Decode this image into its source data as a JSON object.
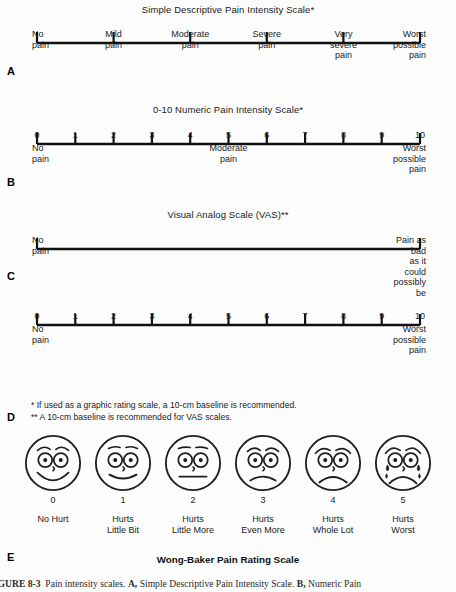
{
  "figure": {
    "caption_prefix": "FIGURE 8-3",
    "caption_text": "Pain intensity scales.",
    "caption_a_letter": "A,",
    "caption_a_text": "Simple Descriptive Pain Intensity Scale.",
    "caption_b_letter": "B,",
    "caption_b_text": "Numeric Pain",
    "colors": {
      "ink": "#1a1a1a",
      "line": "#111111",
      "background": "#fdfdfd"
    }
  },
  "panels": {
    "a": {
      "letter": "A",
      "title": "Simple Descriptive Pain Intensity Scale*",
      "tick_count": 6,
      "labels": [
        "No\npain",
        "Mild\npain",
        "Moderate\npain",
        "Severe\npain",
        "Very\nsevere\npain",
        "Worst\npossible\npain"
      ]
    },
    "b": {
      "letter": "B",
      "title": "0-10 Numeric Pain Intensity Scale*",
      "numbers": [
        "0",
        "1",
        "2",
        "3",
        "4",
        "5",
        "6",
        "7",
        "8",
        "9",
        "10"
      ],
      "anchors": [
        {
          "at": 0,
          "text": "No\npain",
          "align": "left"
        },
        {
          "at": 5,
          "text": "Moderate\npain",
          "align": "center"
        },
        {
          "at": 10,
          "text": "Worst\npossible\npain",
          "align": "right"
        }
      ]
    },
    "c": {
      "letter": "C",
      "title": "Visual Analog Scale (VAS)**",
      "anchors": [
        {
          "at": 0,
          "text": "No\npain",
          "align": "left"
        },
        {
          "at": 1,
          "text": "Pain as bad\nas it could\npossibly be",
          "align": "right"
        }
      ]
    },
    "d": {
      "letter": "D",
      "title": "",
      "numbers": [
        "0",
        "1",
        "2",
        "3",
        "4",
        "5",
        "6",
        "7",
        "8",
        "9",
        "10"
      ],
      "anchors": [
        {
          "at": 0,
          "text": "No\npain",
          "align": "left"
        },
        {
          "at": 10,
          "text": "Worst\npossible\npain",
          "align": "right"
        }
      ],
      "footnote_1": "* If used as a graphic rating scale, a 10-cm baseline is recommended.",
      "footnote_2": "** A 10-cm baseline is recommended for VAS scales."
    },
    "e": {
      "letter": "E",
      "title": "Wong-Baker Pain Rating Scale",
      "faces": [
        {
          "value": "0",
          "label": "No Hurt",
          "expression": "big-smile"
        },
        {
          "value": "1",
          "label": "Hurts\nLittle Bit",
          "expression": "slight-smile"
        },
        {
          "value": "2",
          "label": "Hurts\nLittle More",
          "expression": "neutral"
        },
        {
          "value": "3",
          "label": "Hurts\nEven More",
          "expression": "frown"
        },
        {
          "value": "4",
          "label": "Hurts\nWhole Lot",
          "expression": "deep-frown"
        },
        {
          "value": "5",
          "label": "Hurts\nWorst",
          "expression": "crying"
        }
      ]
    }
  },
  "chart_data": {
    "type": "table",
    "title": "Pain intensity scales",
    "scales": [
      {
        "name": "Simple Descriptive Pain Intensity Scale",
        "type": "categorical",
        "categories": [
          "No pain",
          "Mild pain",
          "Moderate pain",
          "Severe pain",
          "Very severe pain",
          "Worst possible pain"
        ],
        "values": [
          0,
          1,
          2,
          3,
          4,
          5
        ]
      },
      {
        "name": "0-10 Numeric Pain Intensity Scale",
        "type": "numeric",
        "ticks": [
          0,
          1,
          2,
          3,
          4,
          5,
          6,
          7,
          8,
          9,
          10
        ],
        "anchor_labels": {
          "0": "No pain",
          "5": "Moderate pain",
          "10": "Worst possible pain"
        }
      },
      {
        "name": "Visual Analog Scale (VAS)",
        "type": "continuous",
        "range": [
          0,
          100
        ],
        "anchor_labels": {
          "0": "No pain",
          "100": "Pain as bad as it could possibly be"
        }
      },
      {
        "name": "Graphic Rating Scale",
        "type": "numeric",
        "ticks": [
          0,
          1,
          2,
          3,
          4,
          5,
          6,
          7,
          8,
          9,
          10
        ],
        "anchor_labels": {
          "0": "No pain",
          "10": "Worst possible pain"
        }
      },
      {
        "name": "Wong-Baker Pain Rating Scale",
        "type": "faces",
        "values": [
          0,
          1,
          2,
          3,
          4,
          5
        ],
        "labels": [
          "No Hurt",
          "Hurts Little Bit",
          "Hurts Little More",
          "Hurts Even More",
          "Hurts Whole Lot",
          "Hurts Worst"
        ]
      }
    ]
  }
}
